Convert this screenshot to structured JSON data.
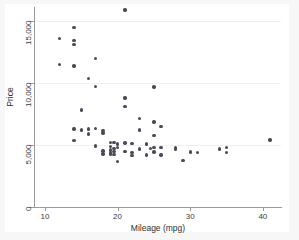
{
  "chart_data": {
    "type": "scatter",
    "title": "",
    "xlabel": "Mileage (mpg)",
    "ylabel": "Price",
    "xlim": [
      8.5,
      42.5
    ],
    "ylim": [
      0,
      16150
    ],
    "xticks": [
      10,
      20,
      30,
      40
    ],
    "xtick_labels": [
      "10",
      "20",
      "30",
      "40"
    ],
    "yticks": [
      0,
      5000,
      10000,
      15000
    ],
    "ytick_labels": [
      "0",
      "5,000",
      "10,000",
      "15,000"
    ],
    "grid": "horizontal-faint",
    "legend": "none",
    "marker_color": "#4a4a5a",
    "background_color": "#ffffff",
    "frame_color": "#f7f7f7",
    "points": [
      {
        "x": 12.0,
        "y": 13594
      },
      {
        "x": 12.0,
        "y": 11497
      },
      {
        "x": 14.0,
        "y": 14500
      },
      {
        "x": 14.0,
        "y": 13466
      },
      {
        "x": 14.0,
        "y": 13100
      },
      {
        "x": 14.0,
        "y": 11385
      },
      {
        "x": 14.0,
        "y": 6295
      },
      {
        "x": 14.0,
        "y": 5379
      },
      {
        "x": 15.0,
        "y": 7827
      },
      {
        "x": 15.0,
        "y": 6229
      },
      {
        "x": 16.0,
        "y": 10371
      },
      {
        "x": 16.0,
        "y": 6303
      },
      {
        "x": 16.0,
        "y": 5899
      },
      {
        "x": 17.0,
        "y": 11995
      },
      {
        "x": 17.0,
        "y": 9735
      },
      {
        "x": 17.0,
        "y": 6342
      },
      {
        "x": 17.0,
        "y": 4934
      },
      {
        "x": 18.0,
        "y": 6165
      },
      {
        "x": 18.0,
        "y": 5988
      },
      {
        "x": 18.0,
        "y": 4516
      },
      {
        "x": 18.0,
        "y": 4296
      },
      {
        "x": 19.0,
        "y": 5222
      },
      {
        "x": 19.0,
        "y": 4890
      },
      {
        "x": 19.0,
        "y": 4589
      },
      {
        "x": 19.0,
        "y": 4425
      },
      {
        "x": 19.0,
        "y": 4296
      },
      {
        "x": 19.5,
        "y": 5189
      },
      {
        "x": 19.5,
        "y": 4733
      },
      {
        "x": 19.5,
        "y": 4482
      },
      {
        "x": 19.5,
        "y": 4258
      },
      {
        "x": 20.0,
        "y": 5079
      },
      {
        "x": 20.0,
        "y": 4816
      },
      {
        "x": 20.0,
        "y": 3667
      },
      {
        "x": 21.0,
        "y": 15906
      },
      {
        "x": 21.0,
        "y": 8814
      },
      {
        "x": 21.0,
        "y": 8129
      },
      {
        "x": 21.0,
        "y": 5172
      },
      {
        "x": 21.0,
        "y": 4504
      },
      {
        "x": 22.0,
        "y": 5104
      },
      {
        "x": 22.0,
        "y": 4424
      },
      {
        "x": 22.0,
        "y": 4172
      },
      {
        "x": 23.0,
        "y": 7140
      },
      {
        "x": 23.0,
        "y": 6229
      },
      {
        "x": 23.0,
        "y": 4697
      },
      {
        "x": 24.0,
        "y": 5079
      },
      {
        "x": 24.0,
        "y": 4187
      },
      {
        "x": 24.5,
        "y": 4733
      },
      {
        "x": 25.0,
        "y": 9690
      },
      {
        "x": 25.0,
        "y": 6850
      },
      {
        "x": 25.0,
        "y": 5798
      },
      {
        "x": 25.0,
        "y": 4816
      },
      {
        "x": 25.0,
        "y": 4453
      },
      {
        "x": 26.0,
        "y": 6486
      },
      {
        "x": 26.0,
        "y": 4816
      },
      {
        "x": 26.0,
        "y": 4187
      },
      {
        "x": 28.0,
        "y": 4816
      },
      {
        "x": 28.0,
        "y": 4697
      },
      {
        "x": 29.0,
        "y": 3748
      },
      {
        "x": 30.0,
        "y": 4452
      },
      {
        "x": 31.0,
        "y": 4425
      },
      {
        "x": 34.0,
        "y": 4697
      },
      {
        "x": 35.0,
        "y": 4816
      },
      {
        "x": 35.0,
        "y": 4389
      },
      {
        "x": 41.0,
        "y": 5397
      }
    ]
  }
}
